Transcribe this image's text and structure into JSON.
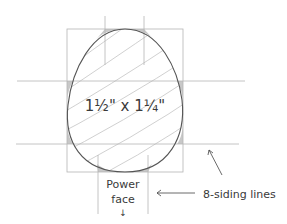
{
  "diagram": {
    "dimension_label": "1½\" x 1¼\"",
    "power_face_label_line1": "Power",
    "power_face_label_line2": "face",
    "power_face_arrow": "↓",
    "callout_label": "8-siding lines",
    "colors": {
      "guide_line": "#b5b5b5",
      "outline": "#555555",
      "hatch": "#c4c4c4",
      "waste_fill": "#c8c8c8",
      "text": "#3a3a3a"
    }
  }
}
